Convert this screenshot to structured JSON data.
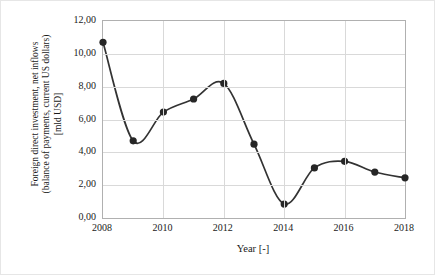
{
  "chart_data": {
    "type": "line",
    "title": "",
    "xlabel": "Year [-]",
    "ylabel": "Foreign direct investment, net inflows (balance of payments, current US dollars) [mld USD]",
    "ylabel_lines": [
      "Foreign direct investment, net inflows",
      "(balance of payments, current US dollars)",
      "[mld USD]"
    ],
    "x": [
      2008,
      2009,
      2010,
      2011,
      2012,
      2013,
      2014,
      2015,
      2016,
      2017,
      2018
    ],
    "values": [
      10.7,
      4.7,
      6.45,
      7.25,
      8.2,
      4.5,
      0.85,
      3.05,
      3.45,
      2.8,
      2.45
    ],
    "categories": [
      "2008",
      "2009",
      "2010",
      "2011",
      "2012",
      "2013",
      "2014",
      "2015",
      "2016",
      "2017",
      "2018"
    ],
    "xlim": [
      2008,
      2018
    ],
    "ylim": [
      0,
      12
    ],
    "ytick_labels": [
      "0,00",
      "2,00",
      "4,00",
      "6,00",
      "8,00",
      "10,00",
      "12,00"
    ],
    "ytick_values": [
      0,
      2,
      4,
      6,
      8,
      10,
      12
    ],
    "xtick_labels": [
      "2008",
      "2010",
      "2012",
      "2014",
      "2016",
      "2018"
    ],
    "xtick_values": [
      2008,
      2010,
      2012,
      2014,
      2016,
      2018
    ],
    "grid": "horizontal-and-vertical",
    "legend": "none",
    "series_color": "#333333",
    "marker": "circle",
    "marker_color": "#262626",
    "line_smoothing": "smooth"
  }
}
